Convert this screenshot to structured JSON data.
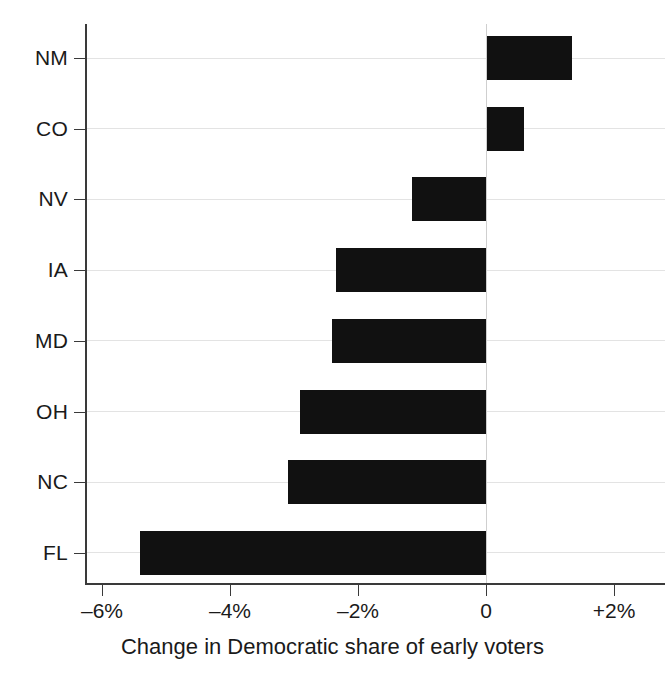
{
  "chart_data": {
    "type": "bar",
    "orientation": "horizontal",
    "title": "",
    "subtitle": "",
    "xlabel": "Change in Democratic share of early voters",
    "ylabel": "",
    "categories": [
      "NM",
      "CO",
      "NV",
      "IA",
      "MD",
      "OH",
      "NC",
      "FL"
    ],
    "values": [
      1.35,
      0.6,
      -1.15,
      -2.35,
      -2.4,
      -2.9,
      -3.1,
      -5.4
    ],
    "series": [
      {
        "name": "Change in Democratic share of early voters",
        "values": [
          1.35,
          0.6,
          -1.15,
          -2.35,
          -2.4,
          -2.9,
          -3.1,
          -5.4
        ]
      }
    ],
    "points": [
      {
        "category": "NM",
        "value": 1.35
      },
      {
        "category": "CO",
        "value": 0.6
      },
      {
        "category": "NV",
        "value": -1.15
      },
      {
        "category": "IA",
        "value": -2.35
      },
      {
        "category": "MD",
        "value": -2.4
      },
      {
        "category": "OH",
        "value": -2.9
      },
      {
        "category": "NC",
        "value": -3.1
      },
      {
        "category": "FL",
        "value": -5.4
      }
    ],
    "xlim": [
      -6.6,
      2.8
    ],
    "xticks": [
      -6,
      -4,
      -2,
      0,
      2
    ],
    "xticklabels": [
      "–6%",
      "–4%",
      "–2%",
      "0",
      "+2%"
    ],
    "units": "percentage points",
    "grid": "horizontal",
    "legend": "none",
    "bar_color": "#111111",
    "axis_color": "#3a3a3a",
    "grid_color": "#e3e3e3",
    "zero_line_color": "#cfcfcf",
    "background": "#ffffff"
  },
  "axis": {
    "x_title": "Change in Democratic share of early voters",
    "x_tick_labels": [
      "–6%",
      "–4%",
      "–2%",
      "0",
      "+2%"
    ],
    "y_tick_labels": [
      "NM",
      "CO",
      "NV",
      "IA",
      "MD",
      "OH",
      "NC",
      "FL"
    ]
  }
}
